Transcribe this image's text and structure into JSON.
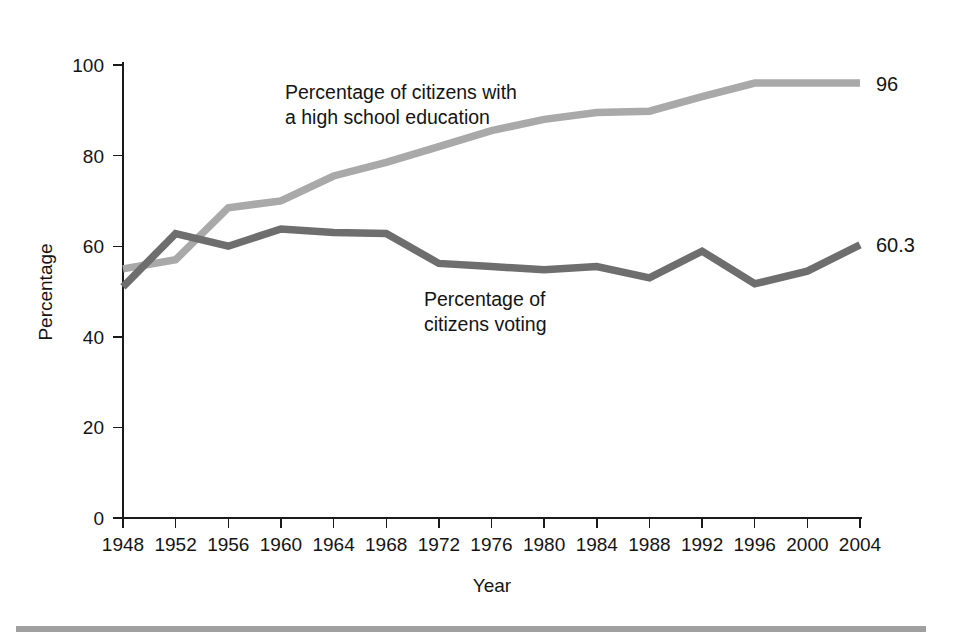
{
  "chart_data": {
    "type": "line",
    "title": "",
    "xlabel": "Year",
    "ylabel": "Percentage",
    "xlim": [
      1948,
      2004
    ],
    "ylim": [
      0,
      100
    ],
    "grid": false,
    "legend_position": "inline-annotations",
    "x": [
      1948,
      1952,
      1956,
      1960,
      1964,
      1968,
      1972,
      1976,
      1980,
      1984,
      1988,
      1992,
      1996,
      2000,
      2004
    ],
    "xticks": [
      "1948",
      "1952",
      "1956",
      "1960",
      "1964",
      "1968",
      "1972",
      "1976",
      "1980",
      "1984",
      "1988",
      "1992",
      "1996",
      "2000",
      "2004"
    ],
    "yticks": [
      "0",
      "20",
      "40",
      "60",
      "80",
      "100"
    ],
    "ytick_values": [
      0,
      20,
      40,
      60,
      80,
      100
    ],
    "series": [
      {
        "name": "Percentage of citizens with a high school education",
        "color": "#a9a9a9",
        "values": [
          55,
          57,
          68.5,
          70,
          75.5,
          78.5,
          82,
          85.5,
          88,
          89.5,
          89.8,
          93,
          96,
          96,
          96
        ],
        "end_label": "96"
      },
      {
        "name": "Percentage of citizens voting",
        "color": "#6e6e6e",
        "values": [
          51,
          62.8,
          60,
          63.8,
          63,
          62.8,
          56.2,
          55.5,
          54.8,
          55.5,
          53,
          58.9,
          51.7,
          54.5,
          60.3
        ],
        "end_label": "60.3"
      }
    ],
    "annotations": [
      {
        "id": "education-annotation",
        "lines": [
          "Percentage of citizens with",
          "a high school education"
        ],
        "x": 1962,
        "y": 91
      },
      {
        "id": "voting-annotation",
        "lines": [
          "Percentage of",
          "citizens voting"
        ],
        "x": 1977,
        "y": 48
      }
    ]
  },
  "axes": {
    "y_title": "Percentage",
    "x_title": "Year"
  },
  "annotations": {
    "education_line1": "Percentage of citizens with",
    "education_line2": "a high school education",
    "voting_line1": "Percentage of",
    "voting_line2": "citizens voting"
  },
  "end_labels": {
    "education": "96",
    "voting": "60.3"
  },
  "yticks": {
    "t0": "0",
    "t20": "20",
    "t40": "40",
    "t60": "60",
    "t80": "80",
    "t100": "100"
  },
  "xticks": {
    "t1948": "1948",
    "t1952": "1952",
    "t1956": "1956",
    "t1960": "1960",
    "t1964": "1964",
    "t1968": "1968",
    "t1972": "1972",
    "t1976": "1976",
    "t1980": "1980",
    "t1984": "1984",
    "t1988": "1988",
    "t1992": "1992",
    "t1996": "1996",
    "t2000": "2000",
    "t2004": "2004"
  },
  "colors": {
    "education_line": "#a9a9a9",
    "voting_line": "#6e6e6e",
    "axis": "#1a1a1a",
    "rule": "#a0a0a0",
    "background": "#ffffff"
  }
}
